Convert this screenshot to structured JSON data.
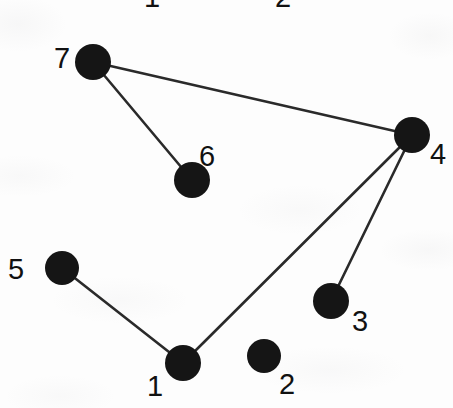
{
  "figure": {
    "type": "node-link-graph",
    "background_color": "#fdfdfd",
    "node_color": "#151515",
    "edge_color": "#2a2a2a",
    "label_color": "#111111",
    "width": 453,
    "height": 408
  },
  "nodes": [
    {
      "id": "1",
      "label": "1",
      "cx": 183,
      "cy": 363,
      "r": 18,
      "label_x": 147,
      "label_y": 372
    },
    {
      "id": "2",
      "label": "2",
      "cx": 264,
      "cy": 356,
      "r": 17,
      "label_x": 279,
      "label_y": 370
    },
    {
      "id": "3",
      "label": "3",
      "cx": 331,
      "cy": 301,
      "r": 18,
      "label_x": 352,
      "label_y": 307
    },
    {
      "id": "4",
      "label": "4",
      "cx": 412,
      "cy": 135,
      "r": 18,
      "label_x": 430,
      "label_y": 140
    },
    {
      "id": "5",
      "label": "5",
      "cx": 62,
      "cy": 268,
      "r": 17,
      "label_x": 8,
      "label_y": 255
    },
    {
      "id": "6",
      "label": "6",
      "cx": 192,
      "cy": 180,
      "r": 18,
      "label_x": 199,
      "label_y": 142
    },
    {
      "id": "7",
      "label": "7",
      "cx": 93,
      "cy": 62,
      "r": 18,
      "label_x": 54,
      "label_y": 44
    }
  ],
  "edges": [
    {
      "id": "edge-7-4",
      "from": "7",
      "to": "4"
    },
    {
      "id": "edge-7-6",
      "from": "7",
      "to": "6"
    },
    {
      "id": "edge-4-1",
      "from": "4",
      "to": "1"
    },
    {
      "id": "edge-4-3",
      "from": "4",
      "to": "3"
    },
    {
      "id": "edge-5-1",
      "from": "5",
      "to": "1"
    }
  ],
  "clipped_top_labels": [
    {
      "id": "top-label-1",
      "label": "1",
      "x": 144,
      "y": -17
    },
    {
      "id": "top-label-2",
      "label": "2",
      "x": 275,
      "y": -17
    }
  ],
  "graph_summary": {
    "node_count": 7,
    "edge_count": 5,
    "isolated_nodes": [
      "2"
    ],
    "edge_list_text": "7-4, 7-6, 4-1, 4-3, 5-1"
  }
}
